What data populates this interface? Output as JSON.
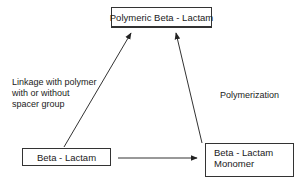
{
  "nodes": {
    "polymeric": {
      "label": "Polymeric Beta - Lactam"
    },
    "beta_lactam": {
      "label": "Beta - Lactam"
    },
    "monomer": {
      "line1": "Beta - Lactam",
      "line2": "Monomer"
    }
  },
  "edges": {
    "linkage": {
      "from": "Beta - Lactam",
      "to": "Polymeric Beta - Lactam",
      "label_lines": [
        "Linkage with polymer",
        "with or without",
        "spacer group"
      ]
    },
    "polymerization": {
      "from": "Beta - Lactam Monomer",
      "to": "Polymeric Beta - Lactam",
      "label": "Polymerization"
    },
    "conversion": {
      "from": "Beta - Lactam",
      "to": "Beta - Lactam Monomer",
      "label": ""
    }
  }
}
